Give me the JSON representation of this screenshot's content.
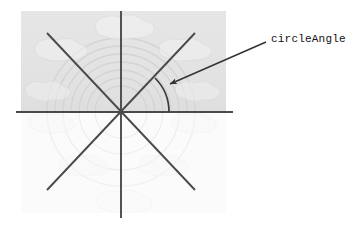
{
  "figure": {
    "title_label": "circleAngle",
    "background_panel": {
      "description": "faint grayscale photographic panel",
      "x": 21,
      "y": 11,
      "width": 205,
      "height": 101,
      "fill": "#e3e3e3",
      "lower_fill": "#fafafa"
    },
    "colors": {
      "line": "#4a4a4a",
      "arc": "#3a3a3a",
      "leader": "#333333",
      "text": "#111111",
      "page_background": "#ffffff",
      "panel_background": "#e3e3e3",
      "watermark": "#d2d2d2"
    },
    "center": {
      "x": 121,
      "y": 112
    },
    "spokes": [
      {
        "name": "horizontal-axis",
        "x1": 16,
        "y1": 112,
        "x2": 233,
        "y2": 112
      },
      {
        "name": "vertical-axis",
        "x1": 121,
        "y1": 11,
        "x2": 121,
        "y2": 218
      },
      {
        "name": "diagonal-nw-se",
        "x1": 47,
        "y1": 33,
        "x2": 195,
        "y2": 190
      },
      {
        "name": "diagonal-ne-sw",
        "x1": 195,
        "y1": 33,
        "x2": 47,
        "y2": 190
      }
    ],
    "angle_arc": {
      "name": "circle-angle-arc",
      "center_x": 121,
      "center_y": 112,
      "radius": 48,
      "start_angle_deg": 0,
      "end_angle_deg": 45
    },
    "leader": {
      "name": "callout-leader",
      "x1": 266,
      "y1": 42,
      "x2": 168,
      "y2": 85,
      "arrowhead_at": "x2,y2"
    },
    "watermark": {
      "arc_center_x": 121,
      "arc_center_y": 112,
      "arc_radii": [
        26,
        34,
        42,
        50,
        58,
        66,
        74
      ],
      "blob_count": 8
    }
  }
}
